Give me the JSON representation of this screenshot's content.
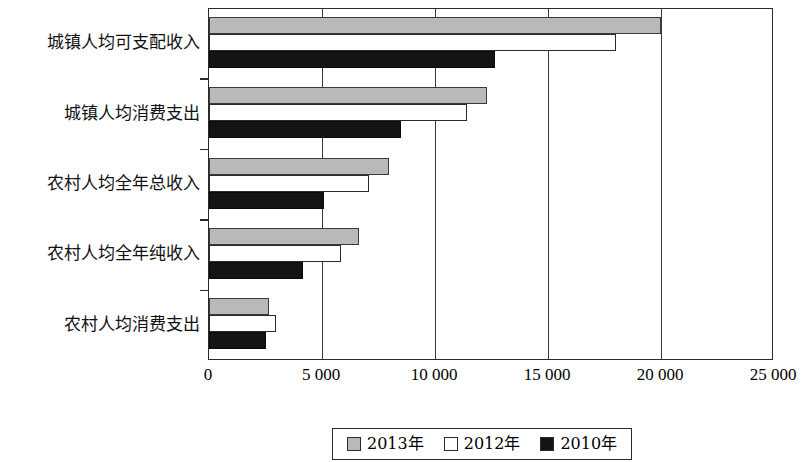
{
  "chart_data": {
    "type": "bar",
    "orientation": "horizontal",
    "title": "",
    "xlabel": "",
    "ylabel": "",
    "xlim": [
      0,
      25000
    ],
    "xticks": [
      "0",
      "5 000",
      "10 000",
      "15 000",
      "20 000",
      "25 000"
    ],
    "xtick_values": [
      0,
      5000,
      10000,
      15000,
      20000,
      25000
    ],
    "grid": true,
    "grid_axis": "x",
    "legend_position": "bottom-center",
    "categories": [
      "农村人均消费支出",
      "农村人均全年纯收入",
      "农村人均全年总收入",
      "城镇人均消费支出",
      "城镇人均可支配收入"
    ],
    "series": [
      {
        "name": "2013年",
        "color": "#b9b9b9",
        "values": [
          2650,
          6640,
          7960,
          12300,
          20000
        ]
      },
      {
        "name": "2012年",
        "color": "#ffffff",
        "values": [
          2960,
          5840,
          7080,
          11420,
          18000
        ]
      },
      {
        "name": "2010年",
        "color": "#141414",
        "values": [
          2520,
          4160,
          5090,
          8500,
          12650
        ]
      }
    ]
  },
  "legend": {
    "items": [
      {
        "label": "2013年",
        "swatch": "gray-swatch"
      },
      {
        "label": "2012年",
        "swatch": "white-swatch"
      },
      {
        "label": "2010年",
        "swatch": "black-swatch"
      }
    ]
  }
}
